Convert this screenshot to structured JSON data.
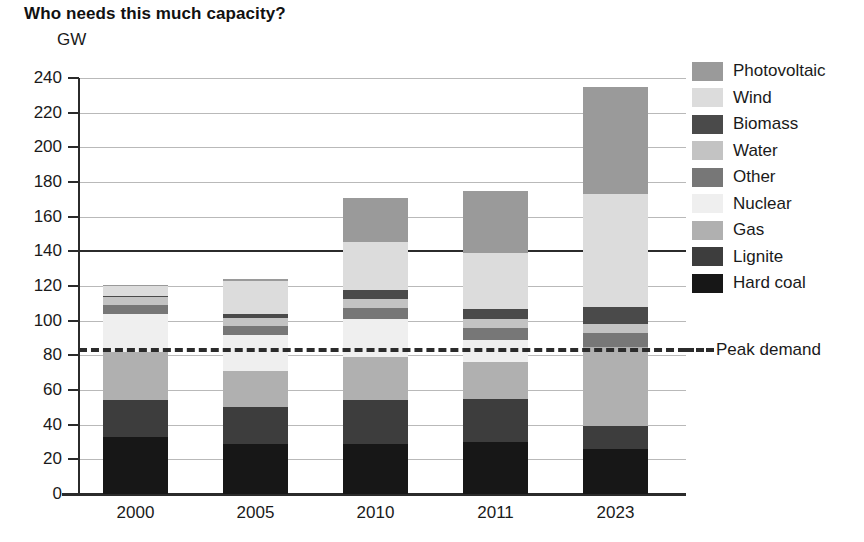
{
  "title": "Who needs this much capacity?",
  "unit_label": "GW",
  "peak_demand": {
    "label": "Peak demand",
    "value": 83
  },
  "legend": {
    "items": [
      {
        "label": "Photovoltaic",
        "color": "#9a9a9a"
      },
      {
        "label": "Wind",
        "color": "#dcdcdc"
      },
      {
        "label": "Biomass",
        "color": "#4a4a4a"
      },
      {
        "label": "Water",
        "color": "#c3c3c3"
      },
      {
        "label": "Other",
        "color": "#777777"
      },
      {
        "label": "Nuclear",
        "color": "#efefef"
      },
      {
        "label": "Gas",
        "color": "#b0b0b0"
      },
      {
        "label": "Lignite",
        "color": "#3d3d3d"
      },
      {
        "label": "Hard coal",
        "color": "#171717"
      }
    ]
  },
  "chart_data": {
    "type": "bar",
    "stacked": true,
    "title": "Who needs this much capacity?",
    "xlabel": "",
    "ylabel": "GW",
    "ylim": [
      0,
      240
    ],
    "ytick_step": 20,
    "yticks": [
      0,
      20,
      40,
      60,
      80,
      100,
      120,
      140,
      160,
      180,
      200,
      220,
      240
    ],
    "grid": true,
    "legend_position": "right",
    "categories": [
      "2000",
      "2005",
      "2010",
      "2011",
      "2023"
    ],
    "stack_order_bottom_up": [
      "Hard coal",
      "Lignite",
      "Gas",
      "Nuclear",
      "Other",
      "Water",
      "Biomass",
      "Wind",
      "Photovoltaic"
    ],
    "series": [
      {
        "name": "Hard coal",
        "color": "#171717",
        "values": [
          33,
          29,
          29,
          30,
          26
        ]
      },
      {
        "name": "Lignite",
        "color": "#3d3d3d",
        "values": [
          21,
          21,
          25,
          25,
          13
        ]
      },
      {
        "name": "Gas",
        "color": "#b0b0b0",
        "values": [
          28,
          21,
          25,
          21,
          46
        ]
      },
      {
        "name": "Nuclear",
        "color": "#efefef",
        "values": [
          22,
          21,
          22,
          13,
          0
        ]
      },
      {
        "name": "Other",
        "color": "#777777",
        "values": [
          5,
          5,
          6.5,
          7,
          8
        ]
      },
      {
        "name": "Water",
        "color": "#c3c3c3",
        "values": [
          4.5,
          4.5,
          5,
          5,
          5
        ]
      },
      {
        "name": "Biomass",
        "color": "#4a4a4a",
        "values": [
          1,
          2.5,
          5,
          6,
          10
        ]
      },
      {
        "name": "Wind",
        "color": "#dcdcdc",
        "values": [
          6,
          19,
          28,
          32,
          65
        ]
      },
      {
        "name": "Photovoltaic",
        "color": "#9a9a9a",
        "values": [
          0.1,
          1,
          25,
          36,
          62
        ]
      }
    ],
    "totals": [
      126,
      137,
      171,
      175,
      235
    ],
    "annotations": [
      {
        "type": "hline",
        "label": "Peak demand",
        "value": 83,
        "style": "dashed"
      }
    ]
  }
}
